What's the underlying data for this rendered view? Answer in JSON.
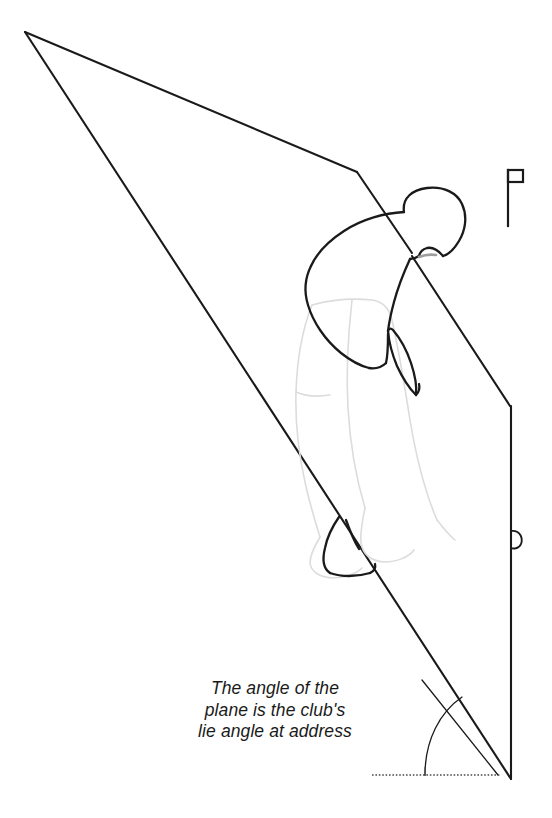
{
  "figure": {
    "name": "golf-swing-plane-diagram",
    "background_color": "#ffffff",
    "ink_color": "#1a1a1a",
    "faint_ink_color": "#d9d9d9",
    "width": 552,
    "height": 818
  },
  "caption": {
    "lines": [
      "The angle of the",
      "plane is the club's",
      "lie angle at address"
    ],
    "full_text": "The angle of the plane is the club's lie angle at address",
    "style": "italic"
  },
  "elements": {
    "swing_plane_label": "swing-plane-quadrilateral",
    "golfer_label": "golfer-figure",
    "flag_label": "flagstick-icon",
    "angle_arc_label": "lie-angle-arc",
    "ground_line_label": "ground-reference-line",
    "club_line_label": "club-shaft-line",
    "loop_label": "plane-edge-loop-detail"
  }
}
